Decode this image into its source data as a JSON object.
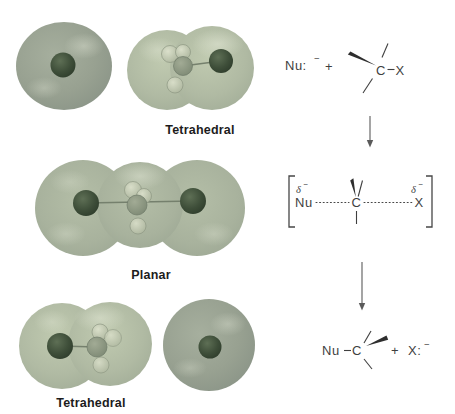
{
  "labels": {
    "row1": "Tetrahedral",
    "row2": "Planar",
    "row3": "Tetrahedral"
  },
  "scheme": {
    "reactants": {
      "nu": "Nu:",
      "nu_charge": "−",
      "plus": "+",
      "carbon": "C",
      "halide": "X"
    },
    "transition_state": {
      "delta_left": "δ",
      "delta_left_charge": "−",
      "nu": "Nu",
      "carbon": "C",
      "halide": "X",
      "delta_right": "δ",
      "delta_right_charge": "−"
    },
    "products": {
      "nu": "Nu",
      "carbon": "C",
      "plus": "+",
      "halide": "X:",
      "halide_charge": "−"
    }
  },
  "colors": {
    "surface_green_light": "#b3bda6",
    "surface_green_mid": "#a8b29d",
    "sphere_green": "#98a191",
    "atom_dark_green": "#3c4c38",
    "carbon_gray_green": "#8e9a85",
    "hydrogen_light": "#ccd3bc",
    "scheme_text": "#3f3f3f"
  }
}
